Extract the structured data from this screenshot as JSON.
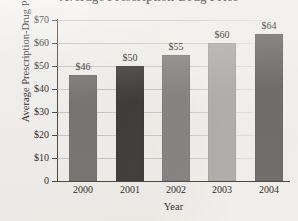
{
  "chart_data": {
    "type": "bar",
    "title": "Average Prescription-Drug Price",
    "xlabel": "Year",
    "ylabel": "Average Prescription-Drug Price",
    "categories": [
      "2000",
      "2001",
      "2002",
      "2003",
      "2004"
    ],
    "values": [
      46,
      50,
      55,
      60,
      64
    ],
    "value_labels": [
      "$46",
      "$50",
      "$55",
      "$60",
      "$64"
    ],
    "ylim": [
      0,
      70
    ],
    "ytick_values": [
      0,
      10,
      20,
      30,
      40,
      50,
      60,
      70
    ],
    "ytick_labels": [
      "0",
      "$10",
      "$20",
      "$30",
      "$40",
      "$50",
      "$60",
      "$70"
    ],
    "grid": true,
    "legend": null,
    "bar_colors": [
      "#767573",
      "#3b3a39",
      "#868584",
      "#b2b1af",
      "#6e6d6b"
    ],
    "axis_color": "#4a4540",
    "background_color": "#f6f4f1"
  }
}
